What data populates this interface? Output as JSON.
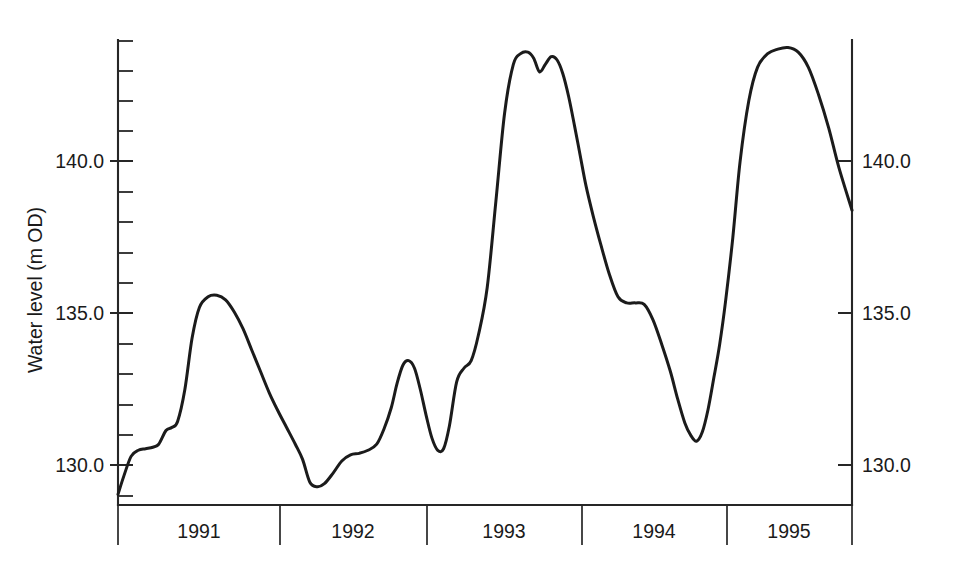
{
  "chart_data": {
    "type": "line",
    "title": "",
    "xlabel": "",
    "ylabel": "Water level (m OD)",
    "ylim": [
      128.6,
      143.9
    ],
    "yticks_major": [
      130.0,
      135.0,
      140.0
    ],
    "ytick_labels_left": [
      "130.0",
      "135.0",
      "140.0"
    ],
    "ytick_labels_right": [
      "130.0",
      "135.0",
      "140.0"
    ],
    "ytick_minor_step": 1.0,
    "grid": false,
    "legend": null,
    "axis_left_label_0": "130.0",
    "axis_left_label_1": "135.0",
    "axis_left_label_2": "140.0",
    "axis_right_label_0": "130.0",
    "axis_right_label_1": "135.0",
    "axis_right_label_2": "140.0",
    "categories": [
      "1991",
      "1992",
      "1993",
      "1994",
      "1995"
    ],
    "x_category_labels": {
      "y1991": "1991",
      "y1992": "1992",
      "y1993": "1993",
      "y1994": "1994",
      "y1995": "1995"
    },
    "x_range_years": [
      1990.9,
      1995.95
    ],
    "series": [
      {
        "name": "Water level",
        "x": [
          1990.9,
          1990.94,
          1990.99,
          1991.04,
          1991.09,
          1991.14,
          1991.18,
          1991.23,
          1991.27,
          1991.31,
          1991.36,
          1991.41,
          1991.46,
          1991.52,
          1991.58,
          1991.64,
          1991.7,
          1991.76,
          1991.82,
          1991.88,
          1991.94,
          1992.0,
          1992.06,
          1992.12,
          1992.17,
          1992.22,
          1992.27,
          1992.32,
          1992.38,
          1992.44,
          1992.5,
          1992.56,
          1992.62,
          1992.68,
          1992.73,
          1992.78,
          1992.82,
          1992.86,
          1992.9,
          1992.94,
          1992.98,
          1993.02,
          1993.06,
          1993.1,
          1993.14,
          1993.18,
          1993.23,
          1993.28,
          1993.33,
          1993.38,
          1993.44,
          1993.5,
          1993.56,
          1993.62,
          1993.67,
          1993.72,
          1993.76,
          1993.8,
          1993.84,
          1993.88,
          1993.92,
          1993.96,
          1994.0,
          1994.04,
          1994.08,
          1994.12,
          1994.17,
          1994.22,
          1994.28,
          1994.34,
          1994.4,
          1994.46,
          1994.52,
          1994.58,
          1994.64,
          1994.7,
          1994.75,
          1994.8,
          1994.84,
          1994.88,
          1994.92,
          1994.96,
          1995.0,
          1995.04,
          1995.08,
          1995.13,
          1995.18,
          1995.24,
          1995.3,
          1995.37,
          1995.44,
          1995.51,
          1995.58,
          1995.65,
          1995.72,
          1995.79,
          1995.86,
          1995.95
        ],
        "y": [
          128.95,
          129.55,
          130.2,
          130.4,
          130.45,
          130.5,
          130.6,
          131.05,
          131.15,
          131.35,
          132.4,
          134.1,
          135.1,
          135.45,
          135.5,
          135.35,
          134.95,
          134.4,
          133.7,
          133.0,
          132.3,
          131.7,
          131.15,
          130.6,
          130.1,
          129.35,
          129.2,
          129.3,
          129.65,
          130.05,
          130.25,
          130.3,
          130.4,
          130.6,
          131.1,
          131.8,
          132.6,
          133.2,
          133.35,
          133.1,
          132.4,
          131.55,
          130.8,
          130.4,
          130.45,
          131.2,
          132.65,
          133.1,
          133.35,
          134.2,
          135.75,
          138.6,
          141.5,
          143.1,
          143.45,
          143.5,
          143.3,
          142.85,
          143.1,
          143.35,
          143.25,
          142.8,
          142.05,
          141.1,
          140.1,
          139.1,
          138.1,
          137.2,
          136.2,
          135.45,
          135.25,
          135.25,
          135.2,
          134.7,
          133.9,
          133.0,
          132.1,
          131.3,
          130.9,
          130.7,
          131.0,
          131.75,
          132.8,
          133.9,
          135.3,
          137.4,
          139.9,
          141.9,
          143.0,
          143.45,
          143.6,
          143.65,
          143.5,
          143.0,
          142.1,
          141.0,
          139.7,
          138.3
        ]
      }
    ],
    "annotations": [],
    "series_note": "Hydrograph showing annual recharge cycles with maxima near 143.5 m OD and minima near 129.2-130.5 m OD"
  },
  "axis": {
    "ylabel": "Water level (m OD)"
  }
}
